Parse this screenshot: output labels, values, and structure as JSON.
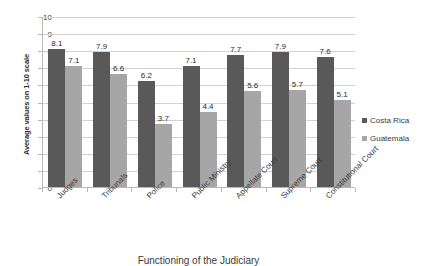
{
  "chart_data": {
    "type": "bar",
    "title": "",
    "xlabel": "Functioning of the Judiciary",
    "ylabel": "Average values on 1-10 scale",
    "categories": [
      "Judges",
      "Tribunals",
      "Police",
      "Public Ministry",
      "Appellate Court",
      "Supreme Court",
      "Constitutional Court"
    ],
    "series": [
      {
        "name": "Costa Rica",
        "color": "#595959",
        "values": [
          8.1,
          7.9,
          6.2,
          7.1,
          7.7,
          7.9,
          7.6
        ]
      },
      {
        "name": "Guatemala",
        "color": "#a6a6a6",
        "values": [
          7.1,
          6.6,
          3.7,
          4.4,
          5.6,
          5.7,
          5.1
        ]
      }
    ],
    "ylim": [
      0,
      10
    ],
    "ytick_labels": [
      "0",
      "1",
      "2",
      "3",
      "4",
      "5",
      "6",
      "7",
      "8",
      "9",
      "10"
    ],
    "ytick_values": [
      0,
      1,
      2,
      3,
      4,
      5,
      6,
      7,
      8,
      9,
      10
    ],
    "grid": "horizontal",
    "legend_position": "right",
    "data_labels": true
  },
  "legend": {
    "items": [
      {
        "label": "Costa Rica",
        "color": "#595959"
      },
      {
        "label": "Guatemala",
        "color": "#a6a6a6"
      }
    ]
  },
  "axes": {
    "y_title": "Average values on 1-10 scale",
    "x_title": "Functioning of the Judiciary"
  }
}
